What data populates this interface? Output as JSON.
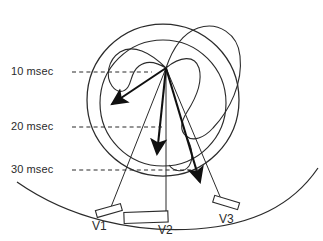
{
  "figure": {
    "background_color": "#ffffff",
    "stroke_color": "#2b2b2b",
    "vector_color": "#101010",
    "dash_color": "#2b2b2b"
  },
  "time_markers": [
    {
      "label": "10 msec",
      "y": 72,
      "dash_start_x": 72,
      "dash_end_x": 152
    },
    {
      "label": "20 msec",
      "y": 127,
      "dash_start_x": 72,
      "dash_end_x": 160
    },
    {
      "label": "30 msec",
      "y": 170,
      "dash_start_x": 72,
      "dash_end_x": 200
    }
  ],
  "electrodes": [
    {
      "label": "V1",
      "x": 113,
      "y": 228,
      "pad_x": 96,
      "pad_y": 208,
      "pad_w": 26,
      "pad_h": 7,
      "pad_rot": -16
    },
    {
      "label": "V2",
      "x": 166,
      "y": 232,
      "pad_x": 124,
      "pad_y": 212,
      "pad_w": 44,
      "pad_h": 11,
      "pad_rot": -3
    },
    {
      "label": "V3",
      "x": 228,
      "y": 222,
      "pad_x": 213,
      "pad_y": 199,
      "pad_w": 26,
      "pad_h": 7,
      "pad_rot": 17
    }
  ],
  "vectors": {
    "origin": {
      "x": 166,
      "y": 68
    },
    "arrows": [
      {
        "name": "vector-1-left",
        "tip_x": 108,
        "tip_y": 107
      },
      {
        "name": "vector-2-down",
        "tip_x": 156,
        "tip_y": 161
      },
      {
        "name": "vector-3-lower-right",
        "tip_x": 204,
        "tip_y": 189
      }
    ]
  },
  "heart": {
    "outer_circle": {
      "cx": 163,
      "cy": 100,
      "r": 76
    },
    "myocardium_inner": {
      "cx": 163,
      "cy": 103,
      "r": 63
    }
  },
  "chest_wall": {
    "description": "chest surface arc"
  }
}
